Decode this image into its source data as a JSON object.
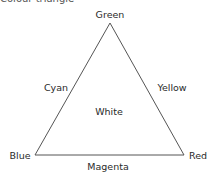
{
  "title": "Colour triangle",
  "vertices": {
    "top": "Green",
    "bottom_left": "Blue",
    "bottom_right": "Red"
  },
  "edges": {
    "left": "Cyan",
    "right": "Yellow",
    "bottom": "Magenta"
  },
  "center": "White",
  "colors": {
    "line": "#555555",
    "text": "#2a2a2a"
  }
}
